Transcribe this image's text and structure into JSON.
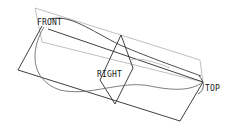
{
  "viewport": {
    "type": "cad-datum-plane-view",
    "background": "#ffffff"
  },
  "datum_planes": [
    {
      "name": "FRONT",
      "label": "FRONT",
      "label_pos": [
        37,
        20
      ]
    },
    {
      "name": "RIGHT",
      "label": "RIGHT",
      "label_pos": [
        97,
        75
      ]
    },
    {
      "name": "TOP",
      "label": "TOP",
      "label_pos": [
        205,
        90
      ]
    }
  ],
  "colors": {
    "edge_dark": "#2a2a2a",
    "edge_light": "#b4b4b4",
    "curve": "#6e6e6e"
  }
}
